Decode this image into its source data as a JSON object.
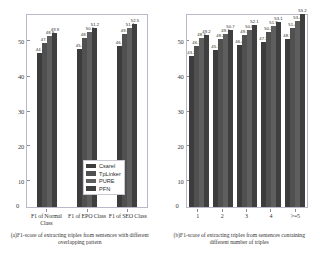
{
  "figure": {
    "caption": ""
  },
  "panels": [
    {
      "sublabel": "(a)F1-score of extracting triples from sentences with different overlapping pattern",
      "yticks": [
        "50",
        "40",
        "30",
        "20",
        "10"
      ],
      "zero": "0",
      "xticks": [
        "F1 of Normal Class",
        "F1 of EPO Class",
        "F1 of SEO Class"
      ],
      "legend": [
        "Csarel",
        "TpLinker",
        "PURE",
        "PFN"
      ]
    },
    {
      "sublabel": "(b)F1-score of extracting triples from sentences containing different number of triples",
      "yticks": [
        "50",
        "40",
        "30",
        "20",
        "10"
      ],
      "zero": "0",
      "xticks": [
        "1",
        "2",
        "3",
        "4",
        ">=5"
      ],
      "legend": [
        "Csarel",
        "TpLinker",
        "PURE",
        "PFN"
      ]
    }
  ],
  "chart_data": [
    {
      "type": "bar",
      "title": "(a)F1-score of extracting triples from sentences with different overlapping pattern",
      "xlabel": "",
      "ylabel": "",
      "ylim": [
        0,
        55
      ],
      "yticks": [
        10,
        20,
        30,
        40,
        50
      ],
      "grid": false,
      "legend_position": "lower-right",
      "categories": [
        "F1 of Normal Class",
        "F1 of EPO Class",
        "F1 of SEO Class"
      ],
      "series": [
        {
          "name": "Csarel",
          "values": [
            44.1,
            45.2,
            46.1
          ],
          "color": "#3c3c3c"
        },
        {
          "name": "TpLinker",
          "values": [
            47.1,
            48.5,
            49.6
          ],
          "color": "#505050"
        },
        {
          "name": "PURE",
          "values": [
            48.9,
            50.1,
            51.4
          ],
          "color": "#5e5e5e"
        },
        {
          "name": "PFN",
          "values": [
            49.9,
            51.2,
            52.5
          ],
          "color": "#3f3f3f"
        }
      ]
    },
    {
      "type": "bar",
      "title": "(b)F1-score of extracting triples from sentences containing different number of triples",
      "xlabel": "",
      "ylabel": "",
      "ylim": [
        0,
        55
      ],
      "yticks": [
        10,
        20,
        30,
        40,
        50
      ],
      "grid": false,
      "legend_position": "lower-right",
      "categories": [
        "1",
        "2",
        "3",
        "4",
        ">=5"
      ],
      "series": [
        {
          "name": "Csarel",
          "values": [
            43.2,
            45.1,
            46.4,
            47.3,
            48.1
          ],
          "color": "#3c3c3c"
        },
        {
          "name": "TpLinker",
          "values": [
            46.1,
            48.2,
            49.3,
            50.2,
            51.4
          ],
          "color": "#505050"
        },
        {
          "name": "PURE",
          "values": [
            48.3,
            49.7,
            50.8,
            51.9,
            53.4
          ],
          "color": "#5e5e5e"
        },
        {
          "name": "PFN",
          "values": [
            49.2,
            50.7,
            52.1,
            53.1,
            55.2
          ],
          "color": "#3f3f3f"
        }
      ]
    }
  ]
}
